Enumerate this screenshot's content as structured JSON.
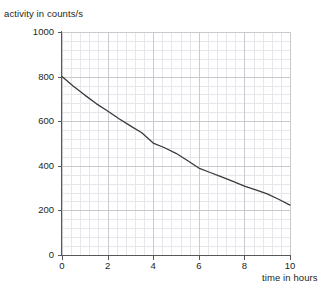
{
  "figure": {
    "y_axis_label": "activity in counts/s",
    "x_axis_label": "time in hours",
    "curve_color": "#3a3a3a",
    "axis_color": "#58585a",
    "major_grid_color": "#c9c9cf",
    "minor_grid_color": "#e6e6ec",
    "background_color": "#ffffff"
  },
  "chart_data": {
    "type": "line",
    "title": "",
    "subtitle": "",
    "xlabel": "time in hours",
    "ylabel": "activity in counts/s",
    "xlim": [
      0,
      10
    ],
    "ylim": [
      0,
      1000
    ],
    "xticks": [
      0,
      2,
      4,
      6,
      8,
      10
    ],
    "xtick_labels": [
      "0",
      "2",
      "4",
      "6",
      "8",
      "10"
    ],
    "yticks": [
      0,
      200,
      400,
      600,
      800,
      1000
    ],
    "ytick_labels": [
      "0",
      "200",
      "400",
      "600",
      "800",
      "1000"
    ],
    "x_minor_step": 0.4,
    "y_minor_step": 40,
    "grid": true,
    "legend": false,
    "legend_position": "none",
    "annotations": [],
    "series": [
      {
        "name": "activity",
        "x": [
          0,
          0.5,
          1,
          1.5,
          2,
          2.5,
          3,
          3.5,
          4,
          4.5,
          5,
          5.5,
          6,
          6.5,
          7,
          7.5,
          8,
          8.5,
          9,
          9.5,
          10
        ],
        "values": [
          800,
          757,
          717,
          679,
          646,
          611,
          579,
          548,
          502,
          481,
          456,
          424,
          390,
          370,
          350,
          330,
          309,
          292,
          274,
          250,
          224
        ]
      }
    ],
    "readings_at_ticks": {
      "x": [
        0,
        2,
        4,
        6,
        8,
        10
      ],
      "y": [
        800,
        646,
        502,
        390,
        309,
        224
      ]
    }
  }
}
